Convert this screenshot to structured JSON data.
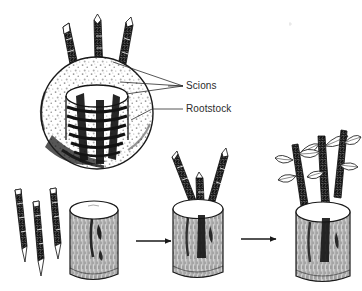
{
  "figure": {
    "background_color": "#ffffff",
    "ink_color": "#1a1a1a",
    "label_color": "#2b2b2b"
  },
  "labels": {
    "scions": "Scions",
    "rootstock": "Rootstock"
  },
  "callouts": [
    {
      "name": "scions-callout",
      "text": "Scions",
      "x": 186,
      "y": 86
    },
    {
      "name": "rootstock-callout",
      "text": "Rootstock",
      "x": 186,
      "y": 109
    }
  ],
  "stages": [
    {
      "id": 1,
      "name": "loose-scions",
      "description": "Three prepared scion sticks with wedge-cut ends"
    },
    {
      "id": 2,
      "name": "bare-rootstock-stump",
      "description": "Cut rootstock stump ready to receive scions"
    },
    {
      "id": 3,
      "name": "grafted-stump",
      "description": "Stump with three scions inserted under the bark"
    },
    {
      "id": 4,
      "name": "sprouted-graft",
      "description": "Grafted scions leafed out and growing"
    }
  ],
  "detail_view": {
    "name": "cross-section-detail",
    "description": "Top view of rootstock showing scions inserted around the cambium ring"
  },
  "arrows": [
    {
      "name": "arrow-stage1-to-stage2",
      "from_stage": 2,
      "to_stage": 3
    },
    {
      "name": "arrow-stage2-to-stage3",
      "from_stage": 3,
      "to_stage": 4
    }
  ],
  "counts": {
    "loose_scions": 3,
    "inserted_scions": 3,
    "detail_scions": 3
  }
}
